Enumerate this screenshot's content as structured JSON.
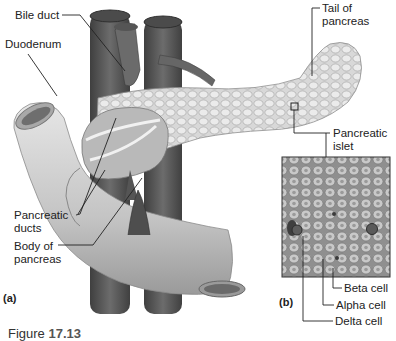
{
  "figure": {
    "caption_prefix": "Figure",
    "caption_number": "17.13",
    "panels": {
      "a": "(a)",
      "b": "(b)"
    }
  },
  "labels": {
    "bile_duct": "Bile duct",
    "duodenum": "Duodenum",
    "tail_of_pancreas_line1": "Tail of",
    "tail_of_pancreas_line2": "pancreas",
    "pancreatic_islet_line1": "Pancreatic",
    "pancreatic_islet_line2": "islet",
    "pancreatic_ducts_line1": "Pancreatic",
    "pancreatic_ducts_line2": "ducts",
    "body_of_pancreas_line1": "Body of",
    "body_of_pancreas_line2": "pancreas",
    "beta_cell": "Beta cell",
    "alpha_cell": "Alpha cell",
    "delta_cell": "Delta cell"
  },
  "colors": {
    "vessel": "#5a5a5a",
    "duodenum": "#cfcfcf",
    "pancreas": "#dadada",
    "islet_bg": "#9c9c9c",
    "leader": "#222222"
  }
}
